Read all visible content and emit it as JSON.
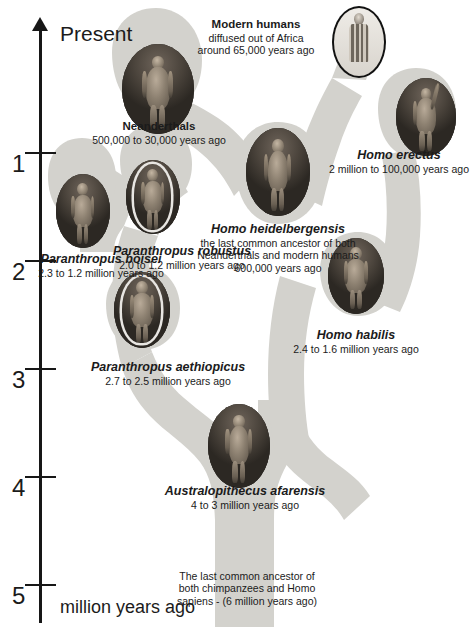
{
  "figure_title": "Human evolutionary tree",
  "axis": {
    "name": "time-axis",
    "top_label": "Present",
    "units_label": "million years ago",
    "ticks": [
      {
        "label": "1",
        "value": 1
      },
      {
        "label": "2",
        "value": 2
      },
      {
        "label": "3",
        "value": 3
      },
      {
        "label": "4",
        "value": 4
      },
      {
        "label": "5",
        "value": 5
      }
    ]
  },
  "colors": {
    "tree_fill": "#d3d2cd",
    "axis": "#171717",
    "text": "#1b1b1b",
    "page_background": "#ffffff"
  },
  "nodes": [
    {
      "id": "modern-humans",
      "name": "Modern humans",
      "name_style": "bold",
      "detail": "diffused out of Africa",
      "detail2": "around 65,000 years ago",
      "image_alt": "Modern human in woven clothing"
    },
    {
      "id": "neanderthals",
      "name": "Neanderthals",
      "name_style": "bold",
      "detail": "500,000 to 30,000 years ago",
      "image_alt": "Neanderthal reconstruction"
    },
    {
      "id": "homo-erectus",
      "name": "Homo erectus",
      "name_style": "bold-italic",
      "detail": "2 million to 100,000 years ago",
      "image_alt": "Homo erectus reconstruction with raised arm"
    },
    {
      "id": "homo-heidelbergensis",
      "name": "Homo heidelbergensis",
      "name_style": "bold-italic",
      "detail": "the last common ancestor of both",
      "detail2": "Neanderthals and modern humans",
      "detail3": "600,000 years ago",
      "image_alt": "Homo heidelbergensis reconstruction"
    },
    {
      "id": "paranthropus-boisei",
      "name": "Paranthropus boisei",
      "name_style": "bold-italic",
      "detail": "2.3 to 1.2 million years ago",
      "image_alt": "Paranthropus boisei reconstruction"
    },
    {
      "id": "paranthropus-robustus",
      "name": "Paranthropus robustus",
      "name_style": "bold-italic",
      "detail": "2.0 to 1.2 million years ago",
      "image_alt": "Paranthropus robustus reconstruction"
    },
    {
      "id": "paranthropus-aethiopicus",
      "name": "Paranthropus aethiopicus",
      "name_style": "bold-italic",
      "detail": "2.7 to 2.5 million years ago",
      "image_alt": "Paranthropus aethiopicus reconstruction"
    },
    {
      "id": "homo-habilis",
      "name": "Homo habilis",
      "name_style": "bold-italic",
      "detail": "2.4 to 1.6 million years ago",
      "image_alt": "Homo habilis reconstruction"
    },
    {
      "id": "australopithecus-afarensis",
      "name": "Australopithecus afarensis",
      "name_style": "bold-italic",
      "detail": "4 to 3 million years ago",
      "image_alt": "Australopithecus afarensis reconstruction"
    },
    {
      "id": "root-ancestor",
      "name": "",
      "detail": "The last common ancestor of",
      "detail2": "both chimpanzees and Homo",
      "detail3": "sapiens - (6 million years ago)"
    }
  ]
}
